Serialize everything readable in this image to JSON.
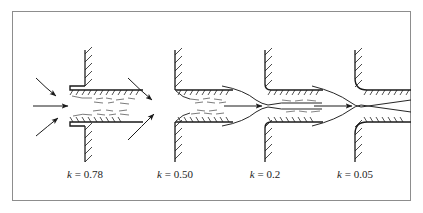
{
  "figure": {
    "border_color": "#8d8d8d",
    "ink_color": "#1a1a1a",
    "background": "#ffffff",
    "width": 423,
    "height": 213
  },
  "panels": [
    {
      "id": "panel-reentrant",
      "symbol": "k",
      "equals": "=",
      "value": "0.78",
      "caption": "k = 0.78",
      "inlet_type": "re-entrant",
      "center_x": 85,
      "description": "Re-entrant (protruding) pipe entrance with large flow separation",
      "separation": "large",
      "streamlines": 3,
      "arrows": 3
    },
    {
      "id": "panel-sharp",
      "symbol": "k",
      "equals": "=",
      "value": "0.50",
      "caption": "k = 0.50",
      "inlet_type": "sharp-edged flush",
      "center_x": 175,
      "description": "Sharp-edged flush entrance with moderate flow separation",
      "separation": "moderate",
      "streamlines": 2,
      "arrows": 2
    },
    {
      "id": "panel-slightly-rounded",
      "symbol": "k",
      "equals": "=",
      "value": "0.2",
      "caption": "k = 0.2",
      "inlet_type": "slightly rounded",
      "center_x": 265,
      "description": "Slightly rounded entrance with small flow separation",
      "separation": "small",
      "streamlines": 2,
      "arrows": 1
    },
    {
      "id": "panel-well-rounded",
      "symbol": "k",
      "equals": "=",
      "value": "0.05",
      "caption": "k = 0.05",
      "inlet_type": "well-rounded bell-mouth",
      "center_x": 355,
      "description": "Well-rounded bell-mouth entrance with no flow separation",
      "separation": "none",
      "streamlines": 2,
      "arrows": 1
    }
  ],
  "geometry": {
    "axis_y": 106,
    "top_wall_y": 90,
    "bottom_wall_y": 122,
    "wall_top_y": 50,
    "wall_bottom_y": 162,
    "pipe_right_x_offset": 58
  }
}
